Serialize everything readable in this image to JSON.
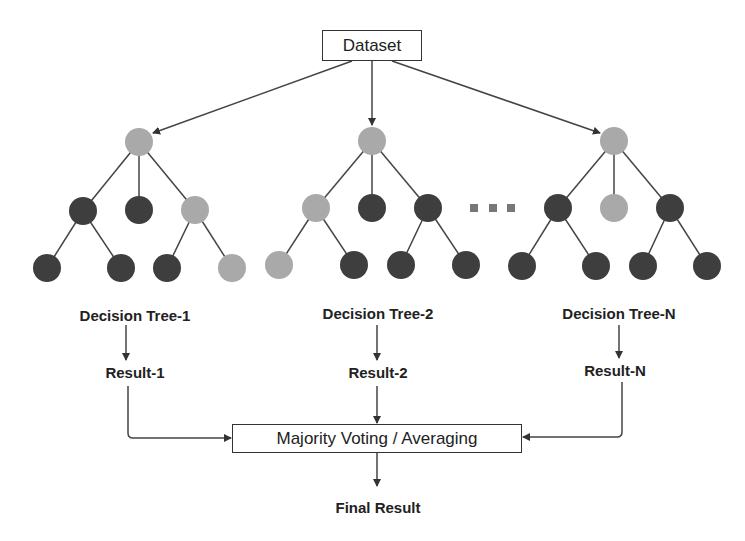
{
  "colors": {
    "split_node": "#a9a9a9",
    "leaf_node": "#3e3e3e",
    "line": "#444444",
    "background": "#ffffff"
  },
  "dataset": {
    "label": "Dataset"
  },
  "ellipsis_icon": "three-squares",
  "trees": [
    {
      "label": "Decision Tree-1",
      "result": "Result-1"
    },
    {
      "label": "Decision Tree-2",
      "result": "Result-2"
    },
    {
      "label": "Decision Tree-N",
      "result": "Result-N"
    }
  ],
  "aggregator": {
    "label": "Majority Voting / Averaging"
  },
  "final": {
    "label": "Final Result"
  }
}
